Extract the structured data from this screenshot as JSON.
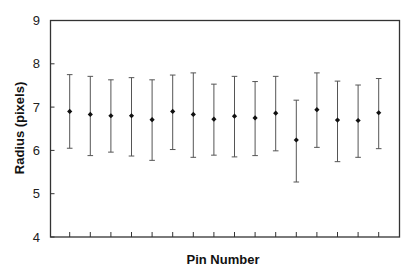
{
  "chart_data": {
    "type": "scatter",
    "subtype": "errorbar",
    "title": "",
    "xlabel": "Pin Number",
    "ylabel": "Radius (pixels)",
    "ylim": [
      4,
      9
    ],
    "yticks": [
      4,
      5,
      6,
      7,
      8,
      9
    ],
    "xtick_labels_shown": false,
    "grid": false,
    "legend": null,
    "x": [
      1,
      2,
      3,
      4,
      5,
      6,
      7,
      8,
      9,
      10,
      11,
      12,
      13,
      14,
      15,
      16
    ],
    "series": [
      {
        "name": "Radius",
        "values": [
          6.9,
          6.83,
          6.8,
          6.8,
          6.71,
          6.9,
          6.83,
          6.72,
          6.79,
          6.75,
          6.86,
          6.24,
          6.94,
          6.7,
          6.69,
          6.87
        ],
        "upper": [
          7.75,
          7.71,
          7.63,
          7.68,
          7.63,
          7.74,
          7.79,
          7.53,
          7.71,
          7.59,
          7.71,
          7.16,
          7.79,
          7.6,
          7.51,
          7.66
        ],
        "lower": [
          6.05,
          5.88,
          5.96,
          5.87,
          5.77,
          6.02,
          5.84,
          5.89,
          5.85,
          5.88,
          5.99,
          5.27,
          6.07,
          5.74,
          5.84,
          6.04
        ],
        "marker": "diamond",
        "color": "#111111",
        "errorbar_color": "#555555"
      }
    ]
  },
  "colors": {
    "axis": "#333333",
    "background": "#ffffff"
  }
}
